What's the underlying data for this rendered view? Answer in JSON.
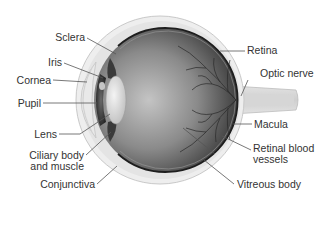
{
  "diagram": {
    "colors": {
      "sclera_fill": "#ececec",
      "sclera_edge": "#c8c8c8",
      "globe_light": "#bdbdbd",
      "globe_dark": "#4a4a4a",
      "retina_line": "#1e1e1e",
      "vessel": "#2a2a2a",
      "leader_line": "#555555",
      "label_text": "#333333"
    },
    "labels_left": [
      {
        "id": "sclera",
        "text": "Sclera"
      },
      {
        "id": "iris",
        "text": "Iris"
      },
      {
        "id": "cornea",
        "text": "Cornea"
      },
      {
        "id": "pupil",
        "text": "Pupil"
      },
      {
        "id": "lens",
        "text": "Lens"
      },
      {
        "id": "ciliary",
        "text_line1": "Ciliary body",
        "text_line2": "and muscle"
      },
      {
        "id": "conjunctiva",
        "text": "Conjunctiva"
      }
    ],
    "labels_right": [
      {
        "id": "retina",
        "text": "Retina"
      },
      {
        "id": "optic-nerve",
        "text": "Optic nerve"
      },
      {
        "id": "macula",
        "text": "Macula"
      },
      {
        "id": "retinal-vessels",
        "text_line1": "Retinal blood",
        "text_line2": "vessels"
      },
      {
        "id": "vitreous",
        "text": "Vitreous body"
      }
    ]
  }
}
